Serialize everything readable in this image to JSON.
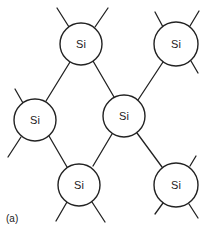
{
  "diagram": {
    "caption": "(a)",
    "atoms": [
      {
        "id": "si-top-center",
        "label": "Si",
        "cx": 81,
        "cy": 44,
        "r": 21
      },
      {
        "id": "si-top-right",
        "label": "Si",
        "cx": 176,
        "cy": 44,
        "r": 22
      },
      {
        "id": "si-mid-left",
        "label": "Si",
        "cx": 35,
        "cy": 120,
        "r": 21
      },
      {
        "id": "si-center",
        "label": "Si",
        "cx": 124,
        "cy": 116,
        "r": 21
      },
      {
        "id": "si-bottom-center",
        "label": "Si",
        "cx": 79,
        "cy": 185,
        "r": 21
      },
      {
        "id": "si-bottom-right",
        "label": "Si",
        "cx": 176,
        "cy": 185,
        "r": 22
      }
    ],
    "bonds": [
      [
        "si-top-center",
        "si-mid-left"
      ],
      [
        "si-top-center",
        "si-center"
      ],
      [
        "si-top-right",
        "si-center"
      ],
      [
        "si-mid-left",
        "si-bottom-center"
      ],
      [
        "si-center",
        "si-bottom-center"
      ],
      [
        "si-center",
        "si-bottom-right"
      ]
    ],
    "colors": {
      "stroke": "#222222",
      "fill": "#ffffff",
      "background": "#ffffff"
    }
  }
}
